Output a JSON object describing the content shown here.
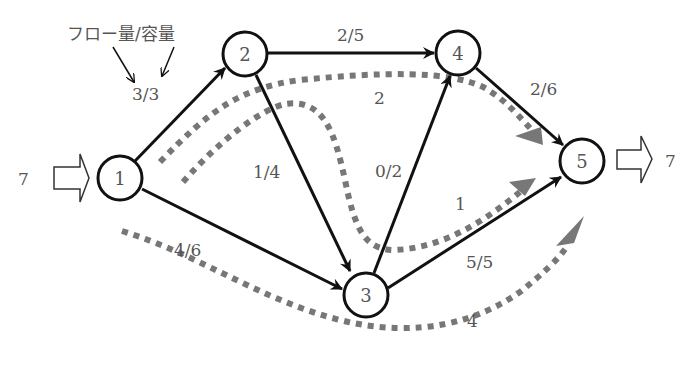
{
  "legend": {
    "title": "フロー量/容量",
    "example": "3/3"
  },
  "source": {
    "node": "1",
    "inflow": "7"
  },
  "sink": {
    "node": "5",
    "outflow": "7"
  },
  "colors": {
    "edge": "#111111",
    "node_stroke": "#111111",
    "path": "#777777",
    "text": "#555555"
  },
  "nodes": [
    {
      "id": "1",
      "label": "1"
    },
    {
      "id": "2",
      "label": "2"
    },
    {
      "id": "3",
      "label": "3"
    },
    {
      "id": "4",
      "label": "4"
    },
    {
      "id": "5",
      "label": "5"
    }
  ],
  "edges": [
    {
      "from": "1",
      "to": "2",
      "flow": 3,
      "capacity": 3,
      "label": "3/3"
    },
    {
      "from": "2",
      "to": "4",
      "flow": 2,
      "capacity": 5,
      "label": "2/5"
    },
    {
      "from": "4",
      "to": "5",
      "flow": 2,
      "capacity": 6,
      "label": "2/6"
    },
    {
      "from": "2",
      "to": "3",
      "flow": 1,
      "capacity": 4,
      "label": "1/4"
    },
    {
      "from": "3",
      "to": "4",
      "flow": 0,
      "capacity": 2,
      "label": "0/2"
    },
    {
      "from": "1",
      "to": "3",
      "flow": 4,
      "capacity": 6,
      "label": "4/6"
    },
    {
      "from": "3",
      "to": "5",
      "flow": 5,
      "capacity": 5,
      "label": "5/5"
    }
  ],
  "flow_paths": [
    {
      "route": [
        "1",
        "2",
        "4",
        "5"
      ],
      "amount": "2"
    },
    {
      "route": [
        "1",
        "2",
        "3",
        "5"
      ],
      "amount": "1"
    },
    {
      "route": [
        "1",
        "3",
        "5"
      ],
      "amount": "4"
    }
  ]
}
